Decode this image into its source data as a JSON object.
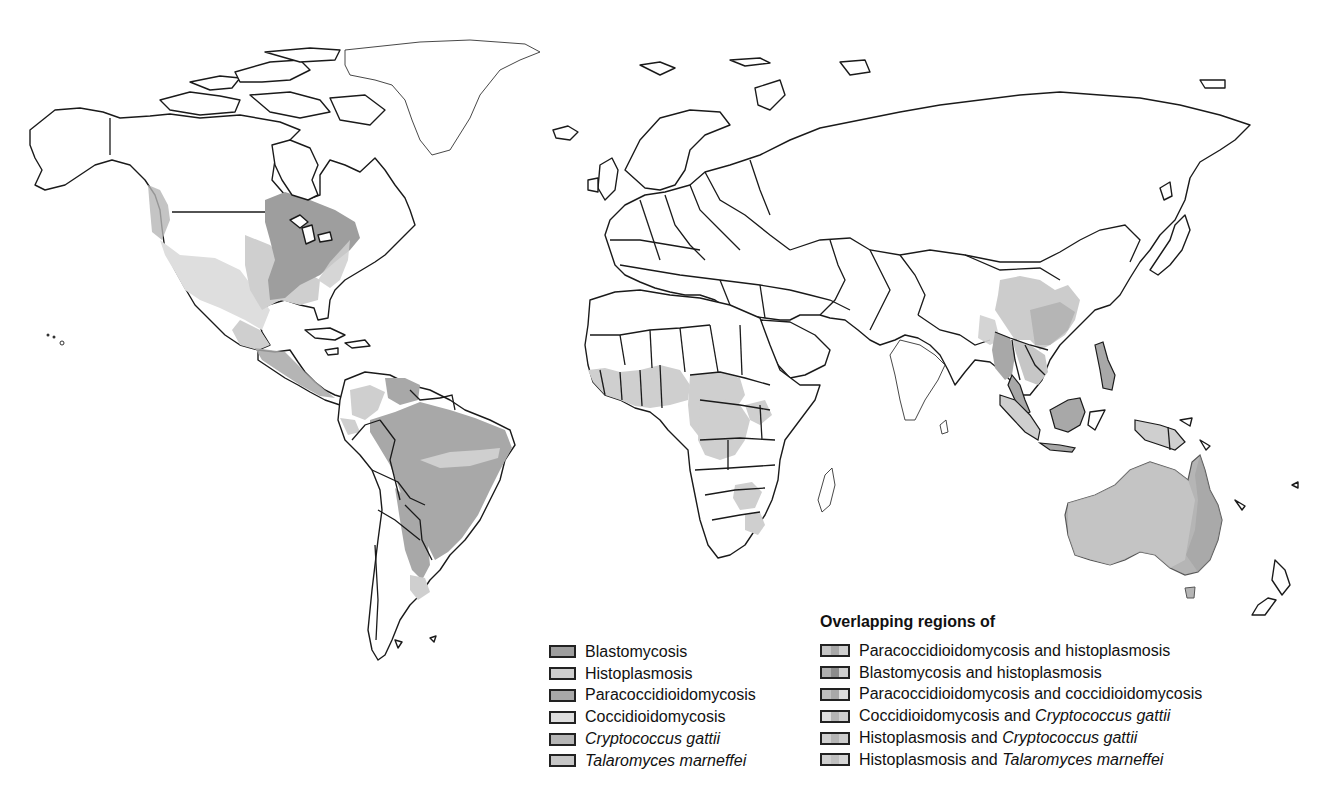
{
  "map": {
    "title": "Geographic distribution of endemic mycoses",
    "regions": [
      {
        "name": "North America (eastern US, Great Lakes, Ohio/Mississippi valleys)",
        "diseases": [
          "Blastomycosis",
          "Histoplasmosis"
        ]
      },
      {
        "name": "Southwestern US / Northern Mexico",
        "diseases": [
          "Coccidioidomycosis"
        ]
      },
      {
        "name": "Pacific Northwest",
        "diseases": [
          "Cryptococcus gattii"
        ]
      },
      {
        "name": "Central America",
        "diseases": [
          "Histoplasmosis",
          "Paracoccidioidomycosis"
        ]
      },
      {
        "name": "Brazil / Northern South America",
        "diseases": [
          "Paracoccidioidomycosis",
          "Histoplasmosis"
        ]
      },
      {
        "name": "Argentina",
        "diseases": [
          "Paracoccidioidomycosis",
          "Coccidioidomycosis"
        ]
      },
      {
        "name": "West & Central Africa",
        "diseases": [
          "Histoplasmosis"
        ]
      },
      {
        "name": "Southern Africa (Zimbabwe, South Africa)",
        "diseases": [
          "Histoplasmosis"
        ]
      },
      {
        "name": "Southern China / India northeast",
        "diseases": [
          "Talaromyces marneffei",
          "Histoplasmosis"
        ]
      },
      {
        "name": "Southeast Asia (Myanmar, Thailand, Vietnam, Indonesia, Malaysia)",
        "diseases": [
          "Histoplasmosis",
          "Talaromyces marneffei"
        ]
      },
      {
        "name": "Papua New Guinea",
        "diseases": [
          "Cryptococcus gattii"
        ]
      },
      {
        "name": "Australia",
        "diseases": [
          "Cryptococcus gattii",
          "Histoplasmosis"
        ]
      }
    ]
  },
  "legend": {
    "single": [
      {
        "label": "Blastomycosis",
        "italic": false,
        "color": "#9e9e9e"
      },
      {
        "label": "Histoplasmosis",
        "italic": false,
        "color": "#cfcfcf"
      },
      {
        "label": "Paracoccidioidomycosis",
        "italic": false,
        "color": "#a8a8a8"
      },
      {
        "label": "Coccidioidomycosis",
        "italic": false,
        "color": "#dedede"
      },
      {
        "label": "Cryptococcus gattii",
        "italic": true,
        "color": "#b5b5b5"
      },
      {
        "label": "Talaromyces marneffei",
        "italic": true,
        "color": "#c6c6c6"
      }
    ],
    "overlap_title": "Overlapping regions of",
    "overlap": [
      {
        "prefix": "Paracoccidioidomycosis and histoplasmosis",
        "italic_part": "",
        "colors": [
          "#c4c4c4",
          "#a8a8a8",
          "#cfcfcf"
        ]
      },
      {
        "prefix": "Blastomycosis and histoplasmosis",
        "italic_part": "",
        "colors": [
          "#b0b0b0",
          "#8c8c8c",
          "#cfcfcf"
        ]
      },
      {
        "prefix": "Paracoccidioidomycosis and coccidioidomycosis",
        "italic_part": "",
        "colors": [
          "#c0c0c0",
          "#a8a8a8",
          "#dedede"
        ]
      },
      {
        "prefix": "Coccidioidomycosis and ",
        "italic_part": "Cryptococcus gattii",
        "colors": [
          "#dedede",
          "#b5b5b5",
          "#d0d0d0"
        ]
      },
      {
        "prefix": "Histoplasmosis and ",
        "italic_part": "Cryptococcus gattii",
        "colors": [
          "#cfcfcf",
          "#b5b5b5",
          "#cccccc"
        ]
      },
      {
        "prefix": "Histoplasmosis and ",
        "italic_part": "Talaromyces marneffei",
        "colors": [
          "#cfcfcf",
          "#c0c0c0",
          "#d6d6d6"
        ]
      }
    ]
  }
}
